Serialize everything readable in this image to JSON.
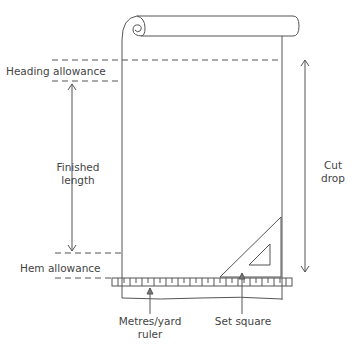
{
  "diagram": {
    "labels": {
      "heading_allowance": "Heading allowance",
      "finished_length_line1": "Finished",
      "finished_length_line2": "length",
      "hem_allowance": "Hem allowance",
      "cut_drop_line1": "Cut",
      "cut_drop_line2": "drop",
      "ruler_line1": "Metres/yard",
      "ruler_line2": "ruler",
      "set_square": "Set square"
    },
    "colors": {
      "line": "#555555",
      "text": "#444444",
      "background": "#ffffff"
    }
  }
}
